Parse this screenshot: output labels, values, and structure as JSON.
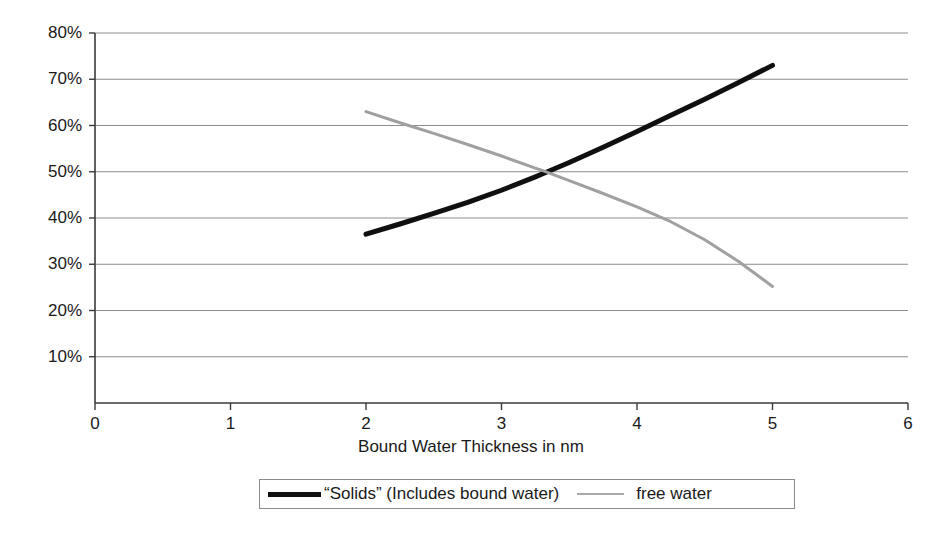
{
  "chart_data": {
    "type": "line",
    "title": "",
    "subtitle": "",
    "xlabel": "Bound Water Thickness in nm",
    "ylabel": "",
    "xlim": [
      0,
      6
    ],
    "ylim": [
      0,
      0.8
    ],
    "xticks": [
      "0",
      "1",
      "2",
      "3",
      "4",
      "5",
      "6"
    ],
    "xtick_values": [
      0,
      1,
      2,
      3,
      4,
      5,
      6
    ],
    "yticks": [
      "10%",
      "20%",
      "30%",
      "40%",
      "50%",
      "60%",
      "70%",
      "80%"
    ],
    "ytick_values": [
      10,
      20,
      30,
      40,
      50,
      60,
      70,
      80
    ],
    "grid": "horizontal",
    "legend_position": "bottom",
    "annotations": [],
    "series": [
      {
        "name": "“Solids” (Includes bound water)",
        "color": "#101010",
        "line_width": 5,
        "x": [
          2.0,
          2.25,
          2.5,
          2.75,
          3.0,
          3.25,
          3.3,
          3.5,
          3.75,
          4.0,
          4.25,
          4.5,
          4.75,
          5.0
        ],
        "values": [
          36.5,
          38.7,
          41.0,
          43.4,
          46.0,
          48.9,
          49.5,
          52.0,
          55.3,
          58.7,
          62.2,
          65.7,
          69.3,
          73.0
        ]
      },
      {
        "name": "free water",
        "color": "#a0a0a0",
        "line_width": 3,
        "x": [
          2.0,
          2.25,
          2.5,
          2.75,
          3.0,
          3.25,
          3.3,
          3.5,
          3.75,
          4.0,
          4.25,
          4.5,
          4.75,
          5.0
        ],
        "values": [
          63.0,
          60.6,
          58.3,
          55.9,
          53.4,
          50.8,
          50.3,
          48.1,
          45.3,
          42.4,
          39.2,
          35.3,
          30.6,
          25.2
        ]
      }
    ]
  },
  "legend": {
    "entries": [
      {
        "label": "“Solids” (Includes bound water)",
        "swatch": "thick-black-line"
      },
      {
        "label": "free water",
        "swatch": "thin-gray-line"
      }
    ]
  },
  "axes": {
    "x_title": "Bound Water Thickness in nm"
  },
  "colors": {
    "solids": "#101010",
    "free_water": "#a0a0a0",
    "axis": "#3a3a3a",
    "grid": "#808080",
    "background": "#ffffff"
  }
}
